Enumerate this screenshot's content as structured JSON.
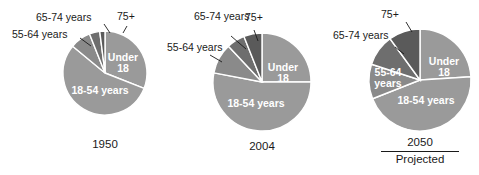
{
  "figure": {
    "title": "",
    "background_color": "#ffffff",
    "text_color": "#1a1a1a"
  },
  "colors": {
    "under_18": "#9a9a9a",
    "18_54": "#9a9a9a",
    "55_64": "#8a8a8a",
    "65_74": "#6e6e6e",
    "75_plus": "#5a5a5a",
    "separator": "#ffffff",
    "label_on_slice": "#ffffff",
    "label_outside": "#1a1a1a"
  },
  "category_labels": {
    "under_18": "Under\n18",
    "under_18_line1": "Under",
    "under_18_line2": "18",
    "age_18_54": "18-54 years",
    "age_55_64": "55-64 years",
    "age_55_64_line1": "55-64",
    "age_55_64_line2": "years",
    "age_65_74": "65-74 years",
    "age_65_74_line1": "65-74",
    "age_65_74_line2": "years",
    "age_75_plus": "75+"
  },
  "charts": [
    {
      "id": "pie-1950",
      "year_label": "1950",
      "projected_note": "",
      "categories": [
        "Under 18",
        "18-54 years",
        "55-64 years",
        "65-74 years",
        "75+"
      ],
      "values": [
        31,
        55,
        8,
        4,
        2
      ]
    },
    {
      "id": "pie-2004",
      "year_label": "2004",
      "projected_note": "",
      "categories": [
        "Under 18",
        "18-54 years",
        "55-64 years",
        "65-74 years",
        "75+"
      ],
      "values": [
        25,
        53,
        10,
        6,
        6
      ]
    },
    {
      "id": "pie-2050",
      "year_label": "2050",
      "projected_note": "Projected",
      "categories": [
        "Under 18",
        "18-54 years",
        "55-64 years",
        "65-74 years",
        "75+"
      ],
      "values": [
        24,
        45,
        11,
        10,
        10
      ]
    }
  ],
  "chart_data": {
    "type": "pie",
    "xlabel": "",
    "ylabel": "",
    "legend_position": "annotated-on-slices",
    "grid": false,
    "units": "percent of total population",
    "categories": [
      "Under 18",
      "18-54 years",
      "55-64 years",
      "65-74 years",
      "75+"
    ],
    "panels": [
      {
        "name": "1950",
        "label": "1950",
        "note": "",
        "values": [
          31,
          55,
          8,
          4,
          2
        ],
        "slices": [
          {
            "label": "Under 18",
            "value": 31,
            "color": "#9a9a9a",
            "label_placement": "inside"
          },
          {
            "label": "18-54 years",
            "value": 55,
            "color": "#9a9a9a",
            "label_placement": "inside"
          },
          {
            "label": "55-64 years",
            "value": 8,
            "color": "#8a8a8a",
            "label_placement": "outside-leader"
          },
          {
            "label": "65-74 years",
            "value": 4,
            "color": "#6e6e6e",
            "label_placement": "outside-leader"
          },
          {
            "label": "75+",
            "value": 2,
            "color": "#5a5a5a",
            "label_placement": "outside-leader"
          }
        ]
      },
      {
        "name": "2004",
        "label": "2004",
        "note": "",
        "values": [
          25,
          53,
          10,
          6,
          6
        ],
        "slices": [
          {
            "label": "Under 18",
            "value": 25,
            "color": "#9a9a9a",
            "label_placement": "inside"
          },
          {
            "label": "18-54 years",
            "value": 53,
            "color": "#9a9a9a",
            "label_placement": "inside"
          },
          {
            "label": "55-64 years",
            "value": 10,
            "color": "#8a8a8a",
            "label_placement": "outside-leader"
          },
          {
            "label": "65-74 years",
            "value": 6,
            "color": "#6e6e6e",
            "label_placement": "outside-leader"
          },
          {
            "label": "75+",
            "value": 6,
            "color": "#5a5a5a",
            "label_placement": "outside-leader"
          }
        ]
      },
      {
        "name": "2050",
        "label": "2050",
        "note": "Projected",
        "values": [
          24,
          45,
          11,
          10,
          10
        ],
        "slices": [
          {
            "label": "Under 18",
            "value": 24,
            "color": "#9a9a9a",
            "label_placement": "inside"
          },
          {
            "label": "18-54 years",
            "value": 45,
            "color": "#9a9a9a",
            "label_placement": "inside"
          },
          {
            "label": "55-64 years",
            "value": 11,
            "color": "#8a8a8a",
            "label_placement": "inside"
          },
          {
            "label": "65-74 years",
            "value": 10,
            "color": "#6e6e6e",
            "label_placement": "outside-leader"
          },
          {
            "label": "75+",
            "value": 10,
            "color": "#5a5a5a",
            "label_placement": "outside-leader"
          }
        ]
      }
    ]
  }
}
